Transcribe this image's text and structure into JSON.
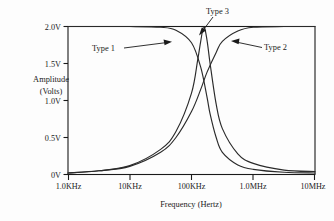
{
  "chart_data": {
    "type": "line",
    "title": "",
    "xlabel": "Frequency (Hertz)",
    "ylabel": "Amplitude (Volts)",
    "ylabel_line1": "Amplitude",
    "ylabel_line2": "(Volts)",
    "x_scale": "log",
    "x_tick_labels": [
      "1.0KHz",
      "10KHz",
      "100KHz",
      "1.0MHz",
      "10MHz"
    ],
    "x_tick_values": [
      1000,
      10000,
      100000,
      1000000,
      10000000
    ],
    "y_tick_labels": [
      "0V",
      "0.5V",
      "1.0V",
      "1.5V",
      "2.0V"
    ],
    "y_tick_values": [
      0,
      0.5,
      1.0,
      1.5,
      2.0
    ],
    "ylim": [
      0,
      2.0
    ],
    "xlim": [
      1000,
      10000000
    ],
    "grid": false,
    "legend": "annotations",
    "series": [
      {
        "name": "Type 1",
        "description": "low-pass: flat at 2.0V then rolls off above 100KHz",
        "x": [
          1000,
          3162,
          10000,
          31620,
          56000,
          100000,
          141000,
          178000,
          200000,
          251000,
          316000,
          562000,
          1000000,
          3162000,
          10000000
        ],
        "y": [
          2.0,
          2.0,
          2.0,
          1.99,
          1.95,
          1.78,
          1.45,
          1.05,
          0.82,
          0.5,
          0.3,
          0.13,
          0.07,
          0.03,
          0.02
        ]
      },
      {
        "name": "Type 2",
        "description": "high-pass: rises from 0V and flattens at 2.0V above 1.0MHz",
        "x": [
          1000,
          3162,
          10000,
          31620,
          56000,
          100000,
          141000,
          178000,
          251000,
          316000,
          562000,
          1000000,
          3162000,
          10000000
        ],
        "y": [
          0.02,
          0.05,
          0.11,
          0.3,
          0.5,
          0.85,
          1.15,
          1.38,
          1.65,
          1.8,
          1.94,
          1.99,
          2.0,
          2.0
        ]
      },
      {
        "name": "Type 3",
        "description": "band-pass: peaks at 2.0V near 160KHz, falls on both sides",
        "x": [
          1000,
          3162,
          10000,
          31620,
          56000,
          100000,
          126000,
          141000,
          158000,
          178000,
          200000,
          251000,
          316000,
          562000,
          1000000,
          3162000,
          10000000
        ],
        "y": [
          0.02,
          0.05,
          0.12,
          0.34,
          0.58,
          1.1,
          1.55,
          1.8,
          2.0,
          1.82,
          1.5,
          0.95,
          0.62,
          0.28,
          0.15,
          0.06,
          0.04
        ]
      }
    ],
    "annotations": [
      {
        "label": "Type 1",
        "points_to": "descending low-pass curve near 100KHz at 1.85V"
      },
      {
        "label": "Type 3",
        "points_to": "band-pass peak at 2.0V near 160KHz"
      },
      {
        "label": "Type 2",
        "points_to": "rising high-pass curve near 700KHz at 1.9V"
      }
    ]
  }
}
